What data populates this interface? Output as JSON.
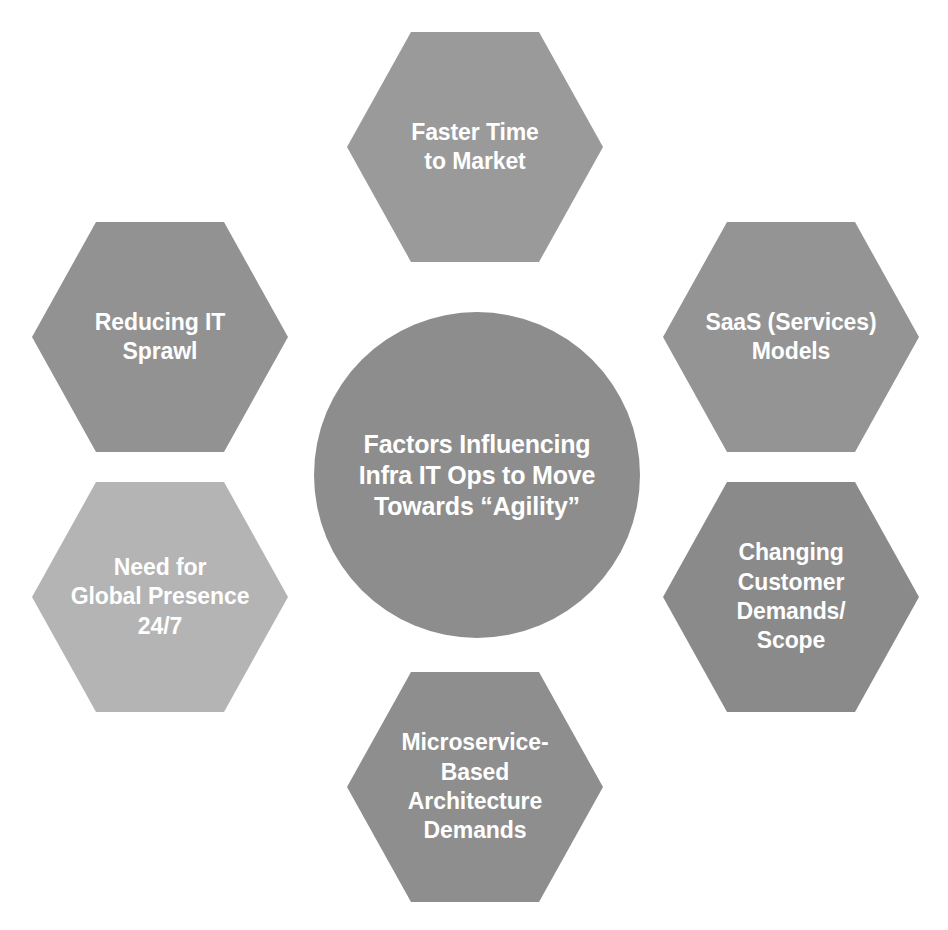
{
  "diagram": {
    "type": "radial-hub-and-spoke",
    "shape_counts": {
      "hub": 1,
      "spokes": 6
    },
    "colors": {
      "background": "#ffffff",
      "hub_fill": "#8d8d8d",
      "hex_fill_default": "#949494",
      "hex_fill_dark": "#8a8a8a",
      "hex_fill_light": "#b4b4b4",
      "text": "#ffffff"
    },
    "hub": {
      "name": "center-circle",
      "label": "Factors Influencing\nInfra IT Ops to Move\nTowards “Agility”",
      "lines": [
        "Factors Influencing",
        "Infra IT Ops to Move",
        "Towards “Agility”"
      ],
      "fill": "#8d8d8d"
    },
    "spokes": [
      {
        "position": "top",
        "name": "faster-time-to-market",
        "label": "Faster Time\nto Market",
        "lines": [
          "Faster Time",
          "to Market"
        ],
        "fill": "#9a9a9a"
      },
      {
        "position": "top-right",
        "name": "saas-services-models",
        "label": "SaaS (Services)\nModels",
        "lines": [
          "SaaS (Services)",
          "Models"
        ],
        "fill": "#949494"
      },
      {
        "position": "bottom-right",
        "name": "changing-customer-demands-scope",
        "label": "Changing\nCustomer\nDemands/\nScope",
        "lines": [
          "Changing",
          "Customer",
          "Demands/",
          "Scope"
        ],
        "fill": "#8a8a8a"
      },
      {
        "position": "bottom",
        "name": "microservice-based-architecture-demands",
        "label": "Microservice-\nBased\nArchitecture\nDemands",
        "lines": [
          "Microservice-",
          "Based",
          "Architecture",
          "Demands"
        ],
        "fill": "#8e8e8e"
      },
      {
        "position": "bottom-left",
        "name": "need-for-global-presence-24-7",
        "label": "Need for\nGlobal Presence\n24/7",
        "lines": [
          "Need for",
          "Global Presence",
          "24/7"
        ],
        "fill": "#b4b4b4"
      },
      {
        "position": "top-left",
        "name": "reducing-it-sprawl",
        "label": "Reducing IT\nSprawl",
        "lines": [
          "Reducing IT",
          "Sprawl"
        ],
        "fill": "#929292"
      }
    ]
  }
}
